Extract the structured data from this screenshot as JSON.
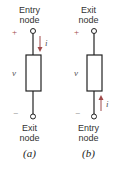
{
  "panels": [
    {
      "id": "a",
      "top_label": [
        "Entry",
        "node"
      ],
      "bottom_label": [
        "Exit",
        "node"
      ],
      "plus": "+",
      "minus": "−",
      "voltage": "v",
      "current": "i",
      "current_direction": "down",
      "current_position": "top",
      "caption": "(a)"
    },
    {
      "id": "b",
      "top_label": [
        "Exit",
        "node"
      ],
      "bottom_label": [
        "Entry",
        "node"
      ],
      "plus": "+",
      "minus": "−",
      "voltage": "v",
      "current": "i",
      "current_direction": "up",
      "current_position": "bottom",
      "caption": "(b)"
    }
  ],
  "colors": {
    "wire": "#222222",
    "arrow": "#a04a4a",
    "sign": "#a04a4a"
  }
}
